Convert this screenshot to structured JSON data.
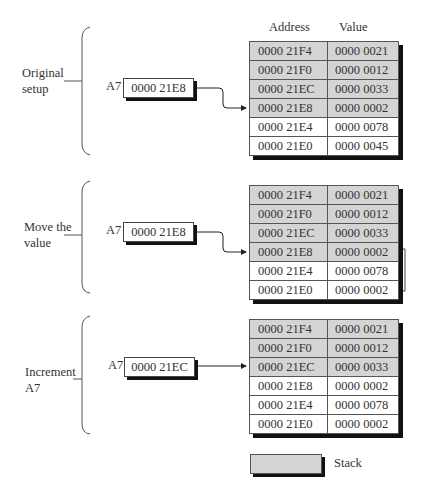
{
  "columns": {
    "address": "Address",
    "value": "Value"
  },
  "register_name": "A7",
  "colors": {
    "stack": "#d4d4d4",
    "free": "#ffffff",
    "shadow": "#111111"
  },
  "panels": [
    {
      "label_line1": "Original",
      "label_line2": "setup",
      "register_value": "0000 21E8",
      "rows": [
        {
          "address": "0000 21F4",
          "value": "0000 0021",
          "stack": true
        },
        {
          "address": "0000 21F0",
          "value": "0000 0012",
          "stack": true
        },
        {
          "address": "0000 21EC",
          "value": "0000 0033",
          "stack": true
        },
        {
          "address": "0000 21E8",
          "value": "0000 0002",
          "stack": true
        },
        {
          "address": "0000 21E4",
          "value": "0000 0078",
          "stack": false
        },
        {
          "address": "0000 21E0",
          "value": "0000 0045",
          "stack": false
        }
      ]
    },
    {
      "label_line1": "Move the",
      "label_line2": "value",
      "register_value": "0000 21E8",
      "rows": [
        {
          "address": "0000 21F4",
          "value": "0000 0021",
          "stack": true
        },
        {
          "address": "0000 21F0",
          "value": "0000 0012",
          "stack": true
        },
        {
          "address": "0000 21EC",
          "value": "0000 0033",
          "stack": true
        },
        {
          "address": "0000 21E8",
          "value": "0000 0002",
          "stack": true
        },
        {
          "address": "0000 21E4",
          "value": "0000 0078",
          "stack": false
        },
        {
          "address": "0000 21E0",
          "value": "0000 0002",
          "stack": false
        }
      ]
    },
    {
      "label_line1": "Increment",
      "label_line2": "A7",
      "register_value": "0000 21EC",
      "rows": [
        {
          "address": "0000 21F4",
          "value": "0000 0021",
          "stack": true
        },
        {
          "address": "0000 21F0",
          "value": "0000 0012",
          "stack": true
        },
        {
          "address": "0000 21EC",
          "value": "0000 0033",
          "stack": true
        },
        {
          "address": "0000 21E8",
          "value": "0000 0002",
          "stack": false
        },
        {
          "address": "0000 21E4",
          "value": "0000 0078",
          "stack": false
        },
        {
          "address": "0000 21E0",
          "value": "0000 0002",
          "stack": false
        }
      ]
    }
  ],
  "legend": {
    "label": "Stack"
  }
}
